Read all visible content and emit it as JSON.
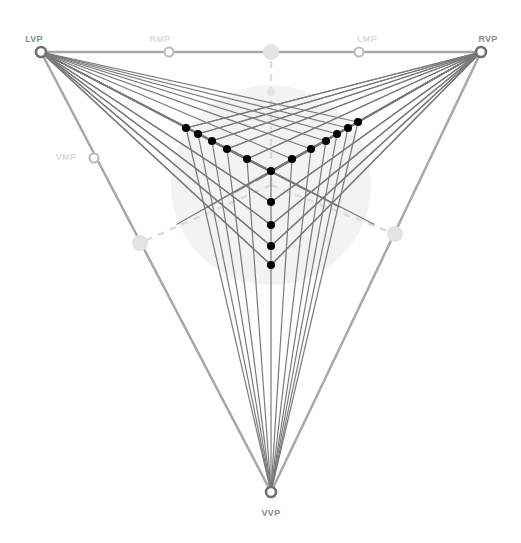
{
  "colors": {
    "frame": "#a8a8a8",
    "ray": "#7a7a7a",
    "dot": "#000000",
    "vp_ring": "#6e6e6e",
    "mp_ring": "#bdbdbd",
    "faint_disc": "#e3e3e3",
    "circle_bg": "#f3f3f3",
    "dashed": "#dcdcdc"
  },
  "vanishing_points": [
    {
      "id": "lvp",
      "label": "LVP",
      "x": 41,
      "y": 52,
      "label_x": 34,
      "label_y": 34
    },
    {
      "id": "rvp",
      "label": "RVP",
      "x": 481,
      "y": 52,
      "label_x": 488,
      "label_y": 34
    },
    {
      "id": "vvp",
      "label": "VVP",
      "x": 271,
      "y": 492,
      "label_x": 271,
      "label_y": 508
    }
  ],
  "measuring_points": [
    {
      "id": "rmp",
      "label": "RMP",
      "x": 169,
      "y": 52,
      "label_x": 160,
      "label_y": 34
    },
    {
      "id": "lmp",
      "label": "LMP",
      "x": 359,
      "y": 52,
      "label_x": 367,
      "label_y": 34
    },
    {
      "id": "vmp",
      "label": "VMP",
      "x": 94,
      "y": 158,
      "label_x": 66,
      "label_y": 152
    }
  ],
  "horizon_centers": [
    {
      "id": "top-center",
      "x": 271,
      "y": 52,
      "r": 8
    },
    {
      "id": "left-center",
      "x": 140,
      "y": 243,
      "r": 8
    },
    {
      "id": "right-center",
      "x": 395,
      "y": 234,
      "r": 8
    },
    {
      "id": "station-point",
      "x": 271,
      "y": 92,
      "r": 4
    }
  ],
  "cone_of_vision": {
    "cx": 271,
    "cy": 185,
    "r": 100
  },
  "corner": {
    "x": 271,
    "y": 171
  },
  "left_edge_dots": [
    [
      247,
      159
    ],
    [
      227,
      149
    ],
    [
      212,
      141
    ],
    [
      198,
      134
    ],
    [
      186,
      128
    ]
  ],
  "right_edge_dots": [
    [
      292,
      159
    ],
    [
      311,
      149
    ],
    [
      326,
      141
    ],
    [
      337,
      134
    ],
    [
      348,
      128
    ],
    [
      358,
      122
    ]
  ],
  "vertical_dots": [
    [
      271,
      202
    ],
    [
      271,
      225
    ],
    [
      271,
      246
    ],
    [
      271,
      265
    ]
  ]
}
